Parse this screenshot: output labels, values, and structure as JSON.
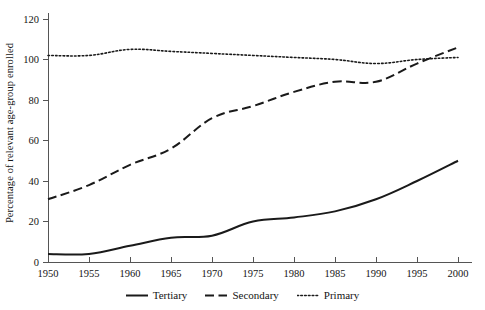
{
  "chart_data": {
    "type": "line",
    "title": "",
    "subtitle": "",
    "xlabel": "",
    "ylabel": "Percentage of relevant age-group enrolled",
    "xlim": [
      1950,
      2000
    ],
    "ylim": [
      0,
      120
    ],
    "grid": false,
    "legend_position": "bottom",
    "x": [
      1950,
      1955,
      1960,
      1965,
      1970,
      1975,
      1980,
      1985,
      1990,
      1995,
      2000
    ],
    "xtick_labels": [
      "1950",
      "1955",
      "1960",
      "1965",
      "1970",
      "1975",
      "1980",
      "1985",
      "1990",
      "1995",
      "2000"
    ],
    "ytick_labels": [
      "0",
      "20",
      "40",
      "60",
      "80",
      "100",
      "120"
    ],
    "yticks": [
      0,
      20,
      40,
      60,
      80,
      100,
      120
    ],
    "series": [
      {
        "name": "Tertiary",
        "style": "solid",
        "color": "#1a1a1a",
        "values": [
          4,
          4,
          8,
          12,
          13,
          20,
          22,
          25,
          31,
          40,
          50
        ]
      },
      {
        "name": "Secondary",
        "style": "dashed",
        "color": "#1a1a1a",
        "values": [
          31,
          38,
          48,
          56,
          71,
          77,
          84,
          89,
          89,
          98,
          106
        ]
      },
      {
        "name": "Primary",
        "style": "dotted",
        "color": "#1a1a1a",
        "values": [
          102,
          102,
          105,
          104,
          103,
          102,
          101,
          100,
          98,
          100,
          101
        ]
      }
    ]
  },
  "legend": {
    "items": [
      {
        "label": "Tertiary",
        "style": "solid"
      },
      {
        "label": "Secondary",
        "style": "dashed"
      },
      {
        "label": "Primary",
        "style": "dotted"
      }
    ]
  },
  "axis": {
    "color": "#555555"
  }
}
